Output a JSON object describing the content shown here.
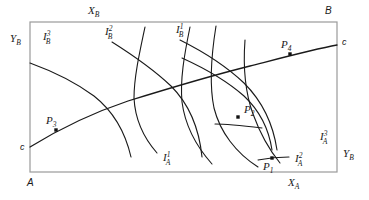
{
  "figure": {
    "type": "edgeworth-box-diagram",
    "title": "",
    "background_color": "#ffffff",
    "line_color": "#1a1a1a",
    "box_color": "#9a9a9a"
  },
  "box": {
    "left": 30,
    "top": 22,
    "right": 337,
    "bottom": 172,
    "corners": {
      "bottom_left_label": "A",
      "top_right_label": "B"
    },
    "axis_labels": {
      "bottom_axis": "X",
      "bottom_axis_sub": "A",
      "left_axis": "Y",
      "left_axis_sub": "B",
      "top_axis": "X",
      "top_axis_sub": "B",
      "right_axis": "Y",
      "right_axis_sub": "B"
    }
  },
  "contract_curve": {
    "name": "contract-curve",
    "start_label": "c",
    "end_label": "c",
    "start_point": [
      30,
      147
    ],
    "end_point": [
      337,
      45
    ],
    "path": "M30,147 C56,131 92,113 128,101 C170,88 210,76 250,66 C285,57 315,49 337,45"
  },
  "indifference_curves_a": [
    {
      "id": "IA1",
      "base": "I",
      "superscript": "1",
      "subscript": "A",
      "label_x": 163,
      "label_y": 161,
      "path": "M145,27 C139,55 134,78 134,98 C135,118 143,137 157,153"
    },
    {
      "id": "IA2",
      "base": "I",
      "superscript": "2",
      "subscript": "A",
      "label_x": 295,
      "label_y": 162,
      "path": "M190,27 C184,56 180,80 182,102 C185,125 196,146 212,164"
    },
    {
      "id": "IA3",
      "base": "I",
      "superscript": "3",
      "subscript": "A",
      "label_x": 320,
      "label_y": 140,
      "path": "M216,26 C211,57 209,84 214,108 C220,132 236,153 258,167"
    },
    {
      "id": "IA4",
      "base": "I",
      "superscript": "",
      "subscript": "",
      "label_x": 0,
      "label_y": 0,
      "path": "M245,40 C243,67 245,92 253,114 C261,136 271,152 280,163"
    }
  ],
  "indifference_curves_b": [
    {
      "id": "IB3",
      "base": "I",
      "superscript": "3",
      "subscript": "B",
      "label_x": 43,
      "label_y": 40,
      "path": "M30,63 C52,71 75,82 94,96 C113,111 125,131 131,157"
    },
    {
      "id": "IB2",
      "base": "I",
      "superscript": "2",
      "subscript": "B",
      "label_x": 105,
      "label_y": 35,
      "path": "M112,42 C131,54 153,69 171,86 C189,104 199,127 202,157"
    },
    {
      "id": "IB1",
      "base": "I",
      "superscript": "1",
      "subscript": "B",
      "label_x": 176,
      "label_y": 33,
      "path": "M180,40 C202,51 226,66 244,83 C262,101 273,123 277,150"
    },
    {
      "id": "IB0",
      "base": "I",
      "superscript": "",
      "subscript": "",
      "label_x": 0,
      "label_y": 0,
      "path": "M182,58 C204,68 227,81 244,96 C260,111 269,130 272,150"
    }
  ],
  "points": [
    {
      "id": "P1",
      "base": "P",
      "subscript": "1",
      "x": 272,
      "y": 158,
      "label_x": 263,
      "label_y": 170
    },
    {
      "id": "P2",
      "base": "P",
      "subscript": "2",
      "x": 238,
      "y": 117,
      "label_x": 244,
      "label_y": 113
    },
    {
      "id": "P3",
      "base": "P",
      "subscript": "3",
      "x": 56,
      "y": 130,
      "label_x": 46,
      "label_y": 124
    },
    {
      "id": "P4",
      "base": "P",
      "subscript": "4",
      "x": 290,
      "y": 54,
      "label_x": 281,
      "label_y": 48
    }
  ],
  "short_segments": [
    {
      "id": "seg-p2-tangent",
      "path": "M215,124 C228,124 245,126 262,128"
    },
    {
      "id": "seg-p1-tangent",
      "path": "M258,160 C268,158 280,157 289,157"
    }
  ]
}
